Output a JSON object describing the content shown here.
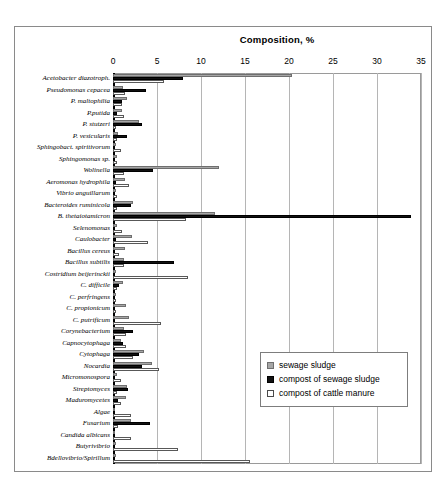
{
  "chart_data": {
    "type": "bar",
    "orientation": "horizontal",
    "title": "Composition, %",
    "xlabel": "Composition, %",
    "ylabel": "",
    "xlim": [
      0,
      35
    ],
    "xticks": [
      0,
      5,
      10,
      15,
      20,
      25,
      30,
      35
    ],
    "grid": true,
    "legend_position": "inside-lower-right",
    "categories": [
      "Acetobacter diazotroph.",
      "Pseudomonas cepacea",
      "P. maltophilia",
      "P.putida",
      "P. stutzeri",
      "P. vesicularis",
      "Sphingobact. spiritivorum",
      "Sphingomonas sp.",
      "Wolinella",
      "Aeromonas hydrophila",
      "Vibrio anguillarum",
      "Bacteroides ruminicola",
      "B. thetaiotamicron",
      "Selenomonas",
      "Caulobacter",
      "Bacillus cereus",
      "Bacillus subtilis",
      "Costridium beijerinckii",
      "C. difficile",
      "C. perfringens",
      "C. propionicum",
      "C. putrificum",
      "Corynebacterium",
      "Capnocytophaga",
      "Cytophaga",
      "Nocardia",
      "Micromonospora",
      "Streptomyces",
      "Maduromycetes",
      "Algae",
      "Fusarium",
      "Candida albicans",
      "Butyrivibrio",
      "Bdellovibrio/Spirillum"
    ],
    "series": [
      {
        "name": "sewage sludge",
        "color": "#a6a6a6",
        "values": [
          20.3,
          1.1,
          1.6,
          1.0,
          3.0,
          0.6,
          0.3,
          0.5,
          12.1,
          1.4,
          0.3,
          2.3,
          11.6,
          0.4,
          2.2,
          1.4,
          1.3,
          0.3,
          1.1,
          0.3,
          1.5,
          1.8,
          1.2,
          0.9,
          3.5,
          4.4,
          0.4,
          1.6,
          1.5,
          0.2,
          2.0,
          0.2,
          0.3,
          0.3
        ]
      },
      {
        "name": "compost of sewage sludge",
        "color": "#111111",
        "values": [
          8.0,
          3.8,
          1.0,
          0.5,
          3.3,
          1.6,
          0.0,
          0.2,
          4.6,
          0.3,
          0.2,
          2.1,
          33.9,
          0.2,
          0.3,
          0.2,
          6.9,
          0.2,
          0.7,
          0.2,
          0.2,
          0.2,
          2.3,
          1.1,
          2.9,
          3.3,
          0.2,
          1.7,
          0.6,
          0.2,
          4.2,
          0.1,
          0.1,
          0.2
        ]
      },
      {
        "name": "compost of cattle manure",
        "color": "#ffffff",
        "values": [
          5.8,
          1.4,
          1.0,
          1.3,
          0.3,
          0.4,
          0.9,
          0.5,
          1.2,
          1.8,
          0.4,
          0.4,
          8.3,
          1.0,
          4.0,
          0.7,
          1.2,
          8.5,
          0.4,
          0.3,
          0.3,
          5.5,
          1.5,
          1.5,
          2.3,
          5.2,
          0.9,
          0.5,
          0.9,
          2.1,
          0.6,
          2.0,
          7.4,
          15.6
        ]
      }
    ],
    "legend": [
      {
        "label": "sewage sludge",
        "swatch": "sludge"
      },
      {
        "label": "compost of sewage sludge",
        "swatch": "compost-sludge"
      },
      {
        "label": "compost of cattle manure",
        "swatch": "compost-manure"
      }
    ]
  }
}
